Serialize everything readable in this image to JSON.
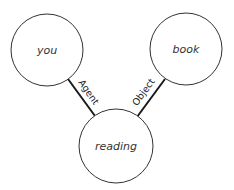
{
  "diagram": {
    "type": "semantic-network",
    "nodes": [
      {
        "id": "you",
        "label": "you",
        "cx": 47,
        "cy": 50,
        "r": 36
      },
      {
        "id": "book",
        "label": "book",
        "cx": 186,
        "cy": 49,
        "r": 36
      },
      {
        "id": "reading",
        "label": "reading",
        "cx": 116,
        "cy": 146,
        "r": 37
      }
    ],
    "edges": [
      {
        "from": "you",
        "to": "reading",
        "label": "Agent"
      },
      {
        "from": "book",
        "to": "reading",
        "label": "Object"
      }
    ],
    "colors": {
      "stroke": "#333333",
      "edge": "#1a1a1a",
      "background": "#ffffff"
    }
  }
}
